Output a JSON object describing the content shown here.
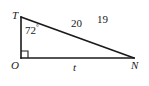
{
  "figure": {
    "type": "right-triangle-diagram",
    "background_color": "#ffffff",
    "stroke_color": "#1a1a1a",
    "vertices": [
      {
        "name": "T",
        "label": "T",
        "x": 21,
        "y": 17
      },
      {
        "name": "O",
        "label": "O",
        "x": 21,
        "y": 58
      },
      {
        "name": "N",
        "label": "N",
        "x": 134,
        "y": 58
      }
    ],
    "right_angle": {
      "at_vertex": "O",
      "marker": "square",
      "size": 7
    },
    "angles": [
      {
        "at_vertex": "T",
        "value": "72",
        "degree_symbol": "°",
        "label": "72°"
      }
    ],
    "sides": [
      {
        "name": "hypotenuse-TN",
        "label": "20",
        "from": "T",
        "to": "N"
      },
      {
        "name": "base-ON",
        "label": "t",
        "from": "O",
        "to": "N"
      },
      {
        "name": "leg-TO",
        "label": "",
        "from": "T",
        "to": "O"
      }
    ],
    "annotations": [
      {
        "name": "extra-value",
        "label": "19"
      }
    ]
  }
}
